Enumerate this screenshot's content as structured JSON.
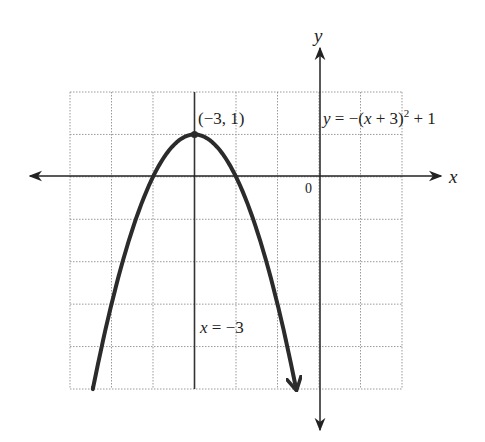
{
  "chart_data": {
    "type": "line",
    "title": "",
    "equation_label": "y = −(x + 3)² + 1",
    "equation": {
      "lhs": "y",
      "eq": " = −(",
      "var": "x",
      "mid": " + 3)",
      "sup": "2",
      "tail": " + 1"
    },
    "xlabel": "x",
    "ylabel": "y",
    "origin_label": "0",
    "vertex": {
      "x": -3,
      "y": 1,
      "label": "(−3, 1)"
    },
    "axis_of_symmetry": {
      "x": -3,
      "label": "x = −3",
      "label_var": "x",
      "label_rest": " = −3"
    },
    "xlim": [
      -6,
      2
    ],
    "ylim": [
      -5,
      2
    ],
    "grid": true,
    "grid_step": 1,
    "series": [
      {
        "name": "y = −(x + 3)² + 1",
        "x": [
          -5.45,
          -5,
          -4.5,
          -4,
          -3.5,
          -3,
          -2.5,
          -2,
          -1.5,
          -1,
          -0.55
        ],
        "y": [
          -5,
          -3,
          -1.25,
          0,
          0.75,
          1,
          0.75,
          0,
          -1.25,
          -3,
          -5
        ]
      }
    ],
    "x_intercepts": [
      -4,
      -2
    ],
    "colors": {
      "curve": "#2b2b2b",
      "axis": "#222222",
      "grid": "#9a9a9a"
    }
  }
}
